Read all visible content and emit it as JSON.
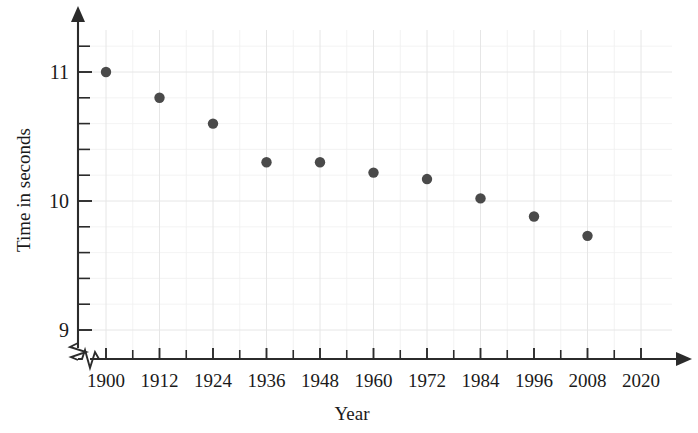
{
  "chart_data": {
    "type": "scatter",
    "title": "",
    "xlabel": "Year",
    "ylabel": "Time in seconds",
    "x": [
      1900,
      1912,
      1924,
      1936,
      1948,
      1960,
      1972,
      1984,
      1996,
      2008
    ],
    "values": [
      11.0,
      10.8,
      10.6,
      10.3,
      10.3,
      10.22,
      10.17,
      10.02,
      9.88,
      9.73
    ],
    "series": [
      {
        "name": "Winning time",
        "points": [
          {
            "x": 1900,
            "y": 11.0
          },
          {
            "x": 1912,
            "y": 10.8
          },
          {
            "x": 1924,
            "y": 10.6
          },
          {
            "x": 1936,
            "y": 10.3
          },
          {
            "x": 1948,
            "y": 10.3
          },
          {
            "x": 1960,
            "y": 10.22
          },
          {
            "x": 1972,
            "y": 10.17
          },
          {
            "x": 1984,
            "y": 10.02
          },
          {
            "x": 1996,
            "y": 9.88
          },
          {
            "x": 2008,
            "y": 9.73
          }
        ]
      }
    ],
    "xlim": [
      1894,
      2026
    ],
    "ylim": [
      8.92,
      11.3
    ],
    "xticks": [
      1900,
      1912,
      1924,
      1936,
      1948,
      1960,
      1972,
      1984,
      1996,
      2008,
      2020
    ],
    "xticklabels": [
      "1900",
      "1912",
      "1924",
      "1936",
      "1948",
      "1960",
      "1972",
      "1984",
      "1996",
      "2008",
      "2020"
    ],
    "xtick_minor_step": 6,
    "yticks": [
      9.0,
      9.2,
      9.4,
      9.6,
      9.8,
      10.0,
      10.2,
      10.4,
      10.6,
      10.8,
      11.0,
      11.2
    ],
    "yticklabels_shown": [
      "9",
      "10",
      "11"
    ],
    "ytick_label_values": [
      9,
      10,
      11
    ],
    "grid": true,
    "grid_color": "#ececec",
    "legend": "none",
    "axis_break_x": true,
    "axis_break_y": true,
    "marker_color": "#4a4a4a",
    "axis_color": "#2b2b2b",
    "background": "#ffffff"
  }
}
